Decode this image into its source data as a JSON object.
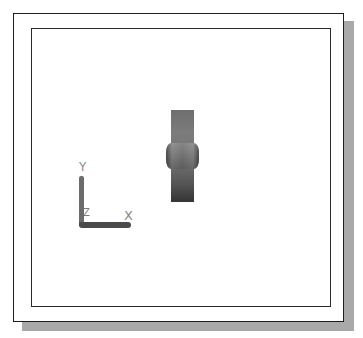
{
  "viewport": {
    "background": "#ffffff",
    "frame_color": "#1e1e1e",
    "shadow_color": "#a9a9a9"
  },
  "model": {
    "name": "wheel",
    "view": "side view",
    "colors": {
      "light": "#7c7c7c",
      "dark": "#343434"
    }
  },
  "ucs_icon": {
    "x_label": "X",
    "y_label": "Y",
    "z_label": "Z"
  }
}
